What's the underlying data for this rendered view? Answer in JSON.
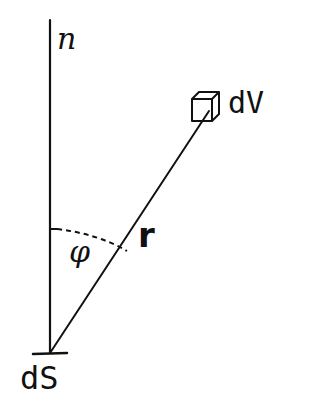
{
  "diagram": {
    "type": "geometry-sketch",
    "labels": {
      "normal": "n",
      "volume_element": "dV",
      "angle": "φ",
      "distance": "r",
      "surface_element": "dS"
    },
    "colors": {
      "ink": "#111111",
      "background": "#ffffff"
    },
    "geometry": {
      "normal_line": {
        "x": 50,
        "y_top": 20,
        "y_bottom": 353
      },
      "surface_tick": {
        "x1": 33,
        "x2": 67,
        "y": 353
      },
      "radius_line": {
        "x1": 50,
        "y1": 353,
        "x2": 210,
        "y2": 110
      },
      "angle_arc": {
        "from": [
          50,
          229
        ],
        "to": [
          128,
          252
        ],
        "style": "dashed"
      },
      "cube": {
        "x": 192,
        "y": 92,
        "size": 24,
        "depth": 7
      }
    }
  }
}
